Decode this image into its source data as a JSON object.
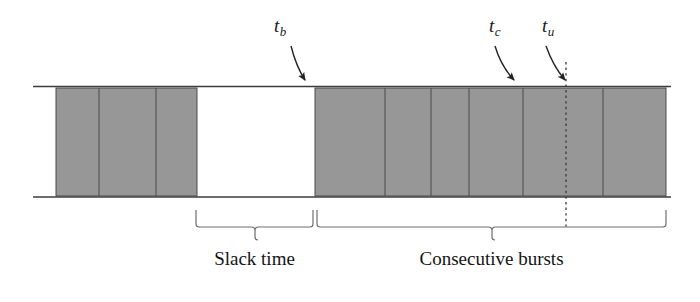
{
  "figure": {
    "colors": {
      "block_fill": "#979797",
      "block_stroke": "#4a4a4a",
      "timeline_line": "#3c3c3c",
      "brace": "#6e6e6e",
      "arrow": "#222222",
      "dashed_line": "#3a3a3a",
      "text": "#141414",
      "background": "#ffffff"
    },
    "timeline": {
      "x_start": 33,
      "x_end": 671,
      "top_y": 86,
      "bottom_y": 197
    },
    "markers": [
      {
        "name": "t-b",
        "symbol": "t",
        "subscript": "b",
        "label_x": 274,
        "label_y": 16,
        "arrow_from": [
          291,
          46
        ],
        "arrow_ctrl": [
          296,
          66
        ],
        "arrow_to": [
          306,
          82
        ]
      },
      {
        "name": "t-c",
        "symbol": "t",
        "subscript": "c",
        "label_x": 489,
        "label_y": 16,
        "arrow_from": [
          495,
          46
        ],
        "arrow_ctrl": [
          502,
          66
        ],
        "arrow_to": [
          516,
          82
        ]
      },
      {
        "name": "t-u",
        "symbol": "t",
        "subscript": "u",
        "label_x": 542,
        "label_y": 16,
        "arrow_from": [
          546,
          46
        ],
        "arrow_ctrl": [
          554,
          66
        ],
        "arrow_to": [
          567,
          82
        ]
      }
    ],
    "dashed_line": {
      "name": "t-u-dashed-guide",
      "x": 566,
      "y_top": 62,
      "y_bottom": 229
    },
    "burst_groups": [
      {
        "name": "first-burst-group",
        "x_start": 56,
        "x_end": 197,
        "dividers": [
          99,
          156
        ],
        "block_count": 3
      },
      {
        "name": "consecutive-burst-group",
        "x_start": 315,
        "x_end": 666,
        "dividers": [
          385,
          431,
          469,
          523,
          603
        ],
        "block_count": 6
      }
    ],
    "braces": [
      {
        "name": "slack-time-brace",
        "x_start": 196,
        "x_end": 313,
        "y_top": 210,
        "y_arm": 223,
        "y_tip": 240,
        "label": "Slack time",
        "label_x": 196,
        "label_width": 117,
        "label_y": 249
      },
      {
        "name": "consecutive-bursts-brace",
        "x_start": 317,
        "x_end": 666,
        "y_top": 210,
        "y_arm": 223,
        "y_tip": 240,
        "label": "Consecutive bursts",
        "label_x": 317,
        "label_width": 349,
        "label_y": 249
      }
    ]
  }
}
